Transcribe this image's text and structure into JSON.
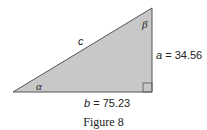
{
  "figure": {
    "caption": "Figure 8",
    "fill_color": "#c8c8c8",
    "stroke_color": "#555555",
    "vertices": {
      "alpha_vertex": [
        13,
        92
      ],
      "right_angle_vertex": [
        152,
        92
      ],
      "beta_vertex": [
        152,
        8
      ]
    },
    "labels": {
      "hypotenuse": "c",
      "angle_alpha": "α",
      "angle_beta": "β",
      "side_a_name": "a",
      "side_a_eq": " = 34.56",
      "side_b_name": "b",
      "side_b_eq": " = 75.23"
    },
    "values": {
      "a": 34.56,
      "b": 75.23
    }
  }
}
